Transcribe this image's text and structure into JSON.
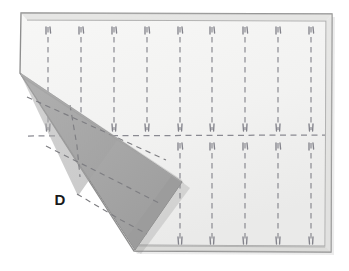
{
  "figure": {
    "background_color": "#ffffff"
  },
  "labels": [
    {
      "id": "fold-label-d",
      "text": "D",
      "x": 60,
      "y": 205,
      "color": "#1a1a1a"
    }
  ],
  "colors": {
    "background": "#ffffff",
    "cloth_face": "#f4f4f2",
    "cloth_face_shade": "#ececeb",
    "cloth_border": "#8e8e8e",
    "hem_band": "#dedede",
    "fold_gray": "#a9a9a9",
    "fold_gray_dark": "#9a9a9a",
    "fold_gray_light": "#b6b6b6",
    "stitch": "#8a8a92",
    "fold_stitch": "#7e7e82",
    "label": "#1a1a1a"
  },
  "cloth": {
    "name": "cloth-body",
    "outline": "21,13 332,14 331,252 134,251 20,73",
    "hem_inset": 7,
    "corners": {
      "top_left": [
        21,
        13
      ],
      "top_right": [
        332,
        14
      ],
      "bottom_right": [
        331,
        252
      ],
      "bottom_left_visible": [
        134,
        251
      ],
      "fold_origin": [
        20,
        73
      ]
    }
  },
  "fold": {
    "name": "folded-triangle",
    "outline": "20,73 182,182 135,250",
    "apex": [
      20,
      73
    ],
    "right_point": [
      182,
      182
    ],
    "bottom_point": [
      135,
      250
    ],
    "fill": "#a9a9a9"
  },
  "stitching": {
    "horizontal_divider": {
      "name": "horizontal-stitch-line",
      "y": 136,
      "x_start": 28,
      "x_end": 325
    },
    "top_band_lines": [
      {
        "x": 48,
        "y_top": 27,
        "y_bottom": 130
      },
      {
        "x": 81,
        "y_top": 27,
        "y_bottom": 130
      },
      {
        "x": 114,
        "y_top": 27,
        "y_bottom": 130
      },
      {
        "x": 147,
        "y_top": 27,
        "y_bottom": 130
      },
      {
        "x": 180,
        "y_top": 27,
        "y_bottom": 130
      },
      {
        "x": 212,
        "y_top": 27,
        "y_bottom": 130
      },
      {
        "x": 245,
        "y_top": 27,
        "y_bottom": 130
      },
      {
        "x": 278,
        "y_top": 27,
        "y_bottom": 130
      },
      {
        "x": 311,
        "y_top": 27,
        "y_bottom": 130
      }
    ],
    "bottom_band_lines": [
      {
        "x": 180,
        "y_top": 143,
        "y_bottom": 243
      },
      {
        "x": 212,
        "y_top": 143,
        "y_bottom": 243
      },
      {
        "x": 245,
        "y_top": 143,
        "y_bottom": 243
      },
      {
        "x": 278,
        "y_top": 143,
        "y_bottom": 243
      },
      {
        "x": 311,
        "y_top": 143,
        "y_bottom": 243
      }
    ],
    "fold_lines": [
      {
        "name": "fold-crease-vertical",
        "path": "M 72,107 L 78,146 L 80,175"
      },
      {
        "name": "fold-crease-upper",
        "path": "M 28,98 L 95,127 L 165,159"
      },
      {
        "name": "fold-crease-middle",
        "path": "M 47,146 L 110,178 L 158,202"
      },
      {
        "name": "fold-crease-lower",
        "path": "M 78,195 L 120,220 L 146,233"
      }
    ]
  },
  "chart_data": {
    "type": "diagram",
    "annotations": [
      "D"
    ]
  }
}
